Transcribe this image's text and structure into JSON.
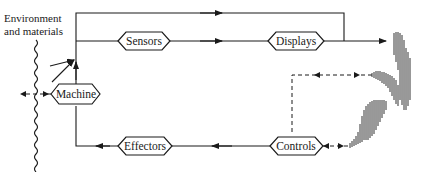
{
  "diagram": {
    "type": "block-diagram",
    "environment_label_line1": "Environment",
    "environment_label_line2": "and materials",
    "nodes": [
      {
        "id": "sensors",
        "label": "Sensors"
      },
      {
        "id": "displays",
        "label": "Displays"
      },
      {
        "id": "machine",
        "label": "Machine"
      },
      {
        "id": "effectors",
        "label": "Effectors"
      },
      {
        "id": "controls",
        "label": "Controls"
      }
    ],
    "edges": [
      {
        "from": "machine",
        "to": "sensors",
        "style": "solid"
      },
      {
        "from": "machine",
        "to": "human-operator",
        "style": "solid",
        "via": "top line"
      },
      {
        "from": "sensors",
        "to": "displays",
        "style": "solid"
      },
      {
        "from": "displays",
        "to": "human-operator",
        "style": "solid"
      },
      {
        "from": "human-operator",
        "to": "controls",
        "style": "dashed"
      },
      {
        "from": "controls",
        "to": "effectors",
        "style": "solid"
      },
      {
        "from": "effectors",
        "to": "machine",
        "style": "solid"
      },
      {
        "from": "environment",
        "to": "machine",
        "style": "solid"
      },
      {
        "from": "machine",
        "to": "environment",
        "style": "dashed"
      }
    ],
    "operator_figure": "hatched human silhouette (operator)"
  }
}
